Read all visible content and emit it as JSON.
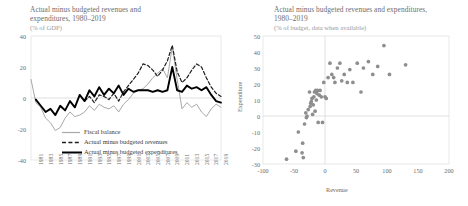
{
  "figure": {
    "panels": [
      {
        "id": "left",
        "title": "Actual minus budgeted revenues and expenditures, 1980–2019",
        "subtitle": "(% of GDP)"
      },
      {
        "id": "right",
        "title": "Actual minus budgeted revenues and expenditures, 1980–2019",
        "subtitle": "(% of budget, data when available)"
      }
    ]
  },
  "chart_data": [
    {
      "type": "line",
      "title": "Actual minus budgeted revenues and expenditures, 1980–2019",
      "subtitle": "(% of GDP)",
      "xlabel": "",
      "ylabel": "",
      "ylim": [
        -40,
        40
      ],
      "yticks": [
        40,
        20,
        0,
        -20,
        -40
      ],
      "grid": false,
      "legend_position": "inside-bottom-left",
      "x": [
        1980,
        1981,
        1982,
        1983,
        1984,
        1985,
        1986,
        1987,
        1988,
        1989,
        1990,
        1991,
        1992,
        1993,
        1994,
        1995,
        1996,
        1997,
        1998,
        1999,
        2000,
        2001,
        2002,
        2003,
        2004,
        2005,
        2006,
        2007,
        2008,
        2009,
        2010,
        2011,
        2012,
        2013,
        2014,
        2015,
        2016,
        2017,
        2018,
        2019
      ],
      "xticks": [
        1981,
        1983,
        1985,
        1987,
        1989,
        1991,
        1993,
        1995,
        1997,
        1999,
        2001,
        2003,
        2005,
        2007,
        2009,
        2011,
        2013,
        2015,
        2017,
        2019
      ],
      "series": [
        {
          "name": "Fiscal balance",
          "style": "solid-light",
          "color": "#a8a8a8",
          "values": [
            12,
            -3,
            -6,
            -13,
            -16,
            -21,
            -19,
            -13,
            -9,
            -12,
            -11,
            -9,
            -5,
            -8,
            -4,
            -6,
            -7,
            -5,
            -9,
            -4,
            -1,
            3,
            5,
            6,
            9,
            13,
            16,
            19,
            13,
            33,
            12,
            -7,
            -3,
            -6,
            -4,
            -9,
            -12,
            -7,
            -4,
            -6
          ]
        },
        {
          "name": "Actual minus budgeted revenues",
          "style": "dashed",
          "color": "#1f1f1f",
          "values": [
            null,
            null,
            null,
            null,
            null,
            null,
            null,
            null,
            null,
            null,
            null,
            -2,
            1,
            -3,
            2,
            1,
            -1,
            3,
            -2,
            4,
            8,
            12,
            16,
            22,
            21,
            18,
            14,
            18,
            24,
            34,
            17,
            10,
            13,
            18,
            22,
            20,
            13,
            7,
            3,
            1
          ]
        },
        {
          "name": "Actual minus budgeted expenditures",
          "style": "solid-bold",
          "color": "#000000",
          "values": [
            null,
            -1,
            -5,
            -9,
            -7,
            -11,
            -5,
            -8,
            -2,
            -6,
            2,
            -2,
            5,
            1,
            7,
            2,
            6,
            3,
            8,
            2,
            6,
            4,
            5,
            5,
            5,
            4,
            5,
            4,
            5,
            20,
            5,
            4,
            8,
            6,
            7,
            5,
            7,
            2,
            -2,
            -3
          ]
        }
      ]
    },
    {
      "type": "scatter",
      "title": "Actual minus budgeted revenues and expenditures, 1980–2019",
      "subtitle": "(% of budget, data when available)",
      "xlabel": "Revenue",
      "ylabel": "Expenditure",
      "xlim": [
        -100,
        200
      ],
      "ylim": [
        -30,
        50
      ],
      "xticks": [
        -100,
        -50,
        0,
        50,
        100,
        150,
        200
      ],
      "yticks": [
        50,
        40,
        30,
        20,
        10,
        0,
        -10,
        -20,
        -30
      ],
      "grid": false,
      "marker_color": "#8e8e8e",
      "points": [
        [
          -62,
          -27
        ],
        [
          -47,
          -22
        ],
        [
          -43,
          -10
        ],
        [
          -37,
          -23
        ],
        [
          -36,
          -17
        ],
        [
          -35,
          -26
        ],
        [
          -33,
          -5
        ],
        [
          -31,
          2
        ],
        [
          -30,
          -1
        ],
        [
          -29,
          0
        ],
        [
          -27,
          4
        ],
        [
          -25,
          15
        ],
        [
          -24,
          6
        ],
        [
          -23,
          8
        ],
        [
          -22,
          9
        ],
        [
          -21,
          11
        ],
        [
          -20,
          1
        ],
        [
          -19,
          7
        ],
        [
          -18,
          12
        ],
        [
          -17,
          15
        ],
        [
          -16,
          3
        ],
        [
          -15,
          16
        ],
        [
          -14,
          10
        ],
        [
          -13,
          14
        ],
        [
          -12,
          16
        ],
        [
          -11,
          -4
        ],
        [
          -9,
          13
        ],
        [
          -8,
          16
        ],
        [
          -6,
          12
        ],
        [
          -4,
          -4
        ],
        [
          -2,
          21
        ],
        [
          0,
          12
        ],
        [
          2,
          11
        ],
        [
          5,
          24
        ],
        [
          8,
          33
        ],
        [
          11,
          26
        ],
        [
          14,
          24
        ],
        [
          16,
          21
        ],
        [
          20,
          30
        ],
        [
          24,
          33
        ],
        [
          27,
          22
        ],
        [
          31,
          26
        ],
        [
          36,
          21
        ],
        [
          40,
          29
        ],
        [
          45,
          21
        ],
        [
          52,
          33
        ],
        [
          58,
          15
        ],
        [
          62,
          30
        ],
        [
          70,
          34
        ],
        [
          77,
          26
        ],
        [
          85,
          31
        ],
        [
          95,
          44
        ],
        [
          104,
          26
        ],
        [
          130,
          32
        ]
      ]
    }
  ],
  "left_panel": {
    "yticks": [
      "40",
      "20",
      "0",
      "-20",
      "-40"
    ],
    "xticks": [
      "1981",
      "1983",
      "1985",
      "1987",
      "1989",
      "1991",
      "1993",
      "1995",
      "1997",
      "1999",
      "2001",
      "2003",
      "2005",
      "2007",
      "2009",
      "2011",
      "2013",
      "2015",
      "2017",
      "2019"
    ],
    "legend": [
      {
        "label": "Fiscal balance",
        "style": "solid-light"
      },
      {
        "label": "Actual minus budgeted revenues",
        "style": "dashed"
      },
      {
        "label": "Actual minus budgeted expenditures",
        "style": "solid-bold"
      }
    ]
  },
  "right_panel": {
    "yticks": [
      "50",
      "40",
      "30",
      "20",
      "10",
      "0",
      "-10",
      "-20",
      "-30"
    ],
    "xticks": [
      "-100",
      "-50",
      "0",
      "50",
      "100",
      "150",
      "200"
    ],
    "xlabel": "Revenue",
    "ylabel": "Expenditure"
  }
}
